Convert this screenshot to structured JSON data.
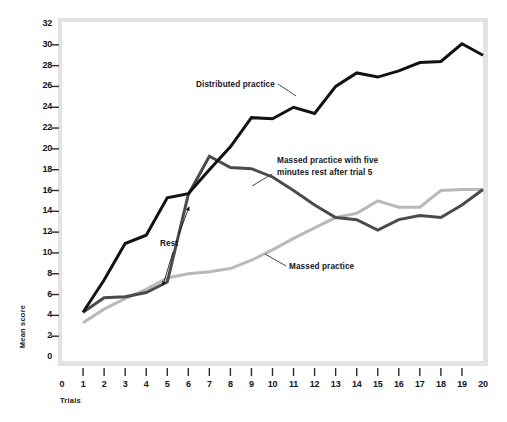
{
  "chart_data": {
    "type": "line",
    "title": "",
    "xlabel": "Trials",
    "ylabel": "Mean score",
    "xlim": [
      0,
      20
    ],
    "ylim": [
      0,
      32
    ],
    "grid": false,
    "legend_position": "inline-annotations",
    "x": [
      1,
      2,
      3,
      4,
      5,
      6,
      7,
      8,
      9,
      10,
      11,
      12,
      13,
      14,
      15,
      16,
      17,
      18,
      19,
      20
    ],
    "xticks": [
      "0",
      "1",
      "2",
      "3",
      "4",
      "5",
      "6",
      "7",
      "8",
      "9",
      "10",
      "11",
      "12",
      "13",
      "14",
      "15",
      "16",
      "17",
      "18",
      "19",
      "20"
    ],
    "yticks": [
      "0",
      "2",
      "4",
      "6",
      "8",
      "10",
      "12",
      "14",
      "16",
      "18",
      "20",
      "22",
      "24",
      "26",
      "28",
      "30",
      "32"
    ],
    "series": [
      {
        "name": "Distributed practice",
        "color": "#121212",
        "width": 3.0,
        "values": [
          4.3,
          7.4,
          10.9,
          11.7,
          15.3,
          15.7,
          18.0,
          20.2,
          23.0,
          22.9,
          24.0,
          23.4,
          26.0,
          27.3,
          26.9,
          27.5,
          28.3,
          28.4,
          30.1,
          29.0
        ]
      },
      {
        "name": "Massed practice with five minutes rest after trial 5",
        "color": "#4a4a52",
        "width": 3.0,
        "values": [
          4.3,
          5.7,
          5.8,
          6.2,
          7.2,
          15.6,
          19.3,
          18.2,
          18.1,
          17.3,
          16.0,
          14.6,
          13.4,
          13.2,
          12.2,
          13.2,
          13.6,
          13.4,
          14.6,
          16.1
        ]
      },
      {
        "name": "Massed practice",
        "color": "#b9b9b9",
        "width": 3.0,
        "values": [
          3.3,
          4.6,
          5.6,
          6.5,
          7.6,
          8.0,
          8.2,
          8.5,
          9.3,
          10.3,
          11.4,
          12.4,
          13.4,
          13.8,
          15.0,
          14.4,
          14.4,
          16.0,
          16.1,
          16.1
        ]
      }
    ],
    "annotations": [
      {
        "name": "distributed-practice-label",
        "text": "Distributed practice",
        "x_px": 196,
        "y_px": 79,
        "leader": {
          "x1": 278,
          "y1": 84,
          "x2": 296,
          "y2": 96
        }
      },
      {
        "name": "massed-practice-rest-label",
        "text": "Massed practice with five\nminutes rest after trial 5",
        "x_px": 277,
        "y_px": 155,
        "leader": {
          "x1": 272,
          "y1": 174,
          "x2": 252,
          "y2": 186
        }
      },
      {
        "name": "massed-practice-label",
        "text": "Massed practice",
        "x_px": 289,
        "y_px": 261,
        "leader": {
          "x1": 286,
          "y1": 266,
          "x2": 265,
          "y2": 254
        }
      },
      {
        "name": "rest-label",
        "text": "Rest",
        "x_px": 160,
        "y_px": 238,
        "arrow_up": {
          "x1": 179,
          "y1": 234,
          "x2": 189,
          "y2": 207
        },
        "arrow_down": {
          "x1": 173,
          "y1": 252,
          "x2": 163,
          "y2": 285
        }
      }
    ]
  },
  "colors": {
    "plot_background": "#ffffff",
    "frame_shadow": "#e2e2e2",
    "axis_text": "#14141e",
    "distributed": "#121212",
    "massed_rest": "#4a4a52",
    "massed": "#b9b9b9"
  }
}
